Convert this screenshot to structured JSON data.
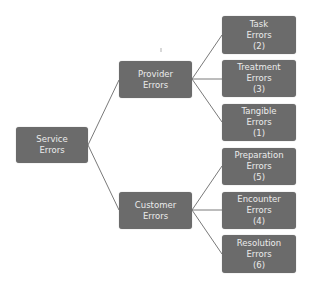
{
  "diagram": {
    "colors": {
      "node_fill": "#6b6b6b",
      "node_text": "#ececec",
      "connector": "#7a7a7a",
      "background": "#ffffff"
    },
    "root": {
      "line1": "Service",
      "line2": "Errors"
    },
    "branches": [
      {
        "line1": "Provider",
        "line2": "Errors",
        "children": [
          {
            "line1": "Task",
            "line2": "Errors",
            "count": "(2)"
          },
          {
            "line1": "Treatment",
            "line2": "Errors",
            "count": "(3)"
          },
          {
            "line1": "Tangible",
            "line2": "Errors",
            "count": "(1)"
          }
        ]
      },
      {
        "line1": "Customer",
        "line2": "Errors",
        "children": [
          {
            "line1": "Preparation",
            "line2": "Errors",
            "count": "(5)"
          },
          {
            "line1": "Encounter",
            "line2": "Errors",
            "count": "(4)"
          },
          {
            "line1": "Resolution",
            "line2": "Errors",
            "count": "(6)"
          }
        ]
      }
    ]
  }
}
